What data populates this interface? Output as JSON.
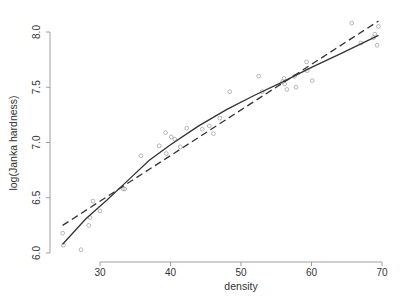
{
  "chart_data": {
    "type": "scatter",
    "title": "",
    "xlabel": "density",
    "ylabel": "log(Janka hardness)",
    "xlim": [
      23.5,
      70.5
    ],
    "ylim": [
      5.95,
      8.15
    ],
    "grid": false,
    "legend": null,
    "x_ticks": [
      30,
      40,
      50,
      60,
      70
    ],
    "y_ticks": [
      6.0,
      6.5,
      7.0,
      7.5,
      8.0
    ],
    "x_tick_labels": [
      "30",
      "40",
      "50",
      "60",
      "70"
    ],
    "y_tick_labels": [
      "6.0",
      "6.5",
      "7.0",
      "7.5",
      "8.0"
    ],
    "points": [
      [
        24.7,
        6.18
      ],
      [
        24.8,
        6.07
      ],
      [
        27.3,
        6.03
      ],
      [
        28.4,
        6.25
      ],
      [
        28.6,
        6.32
      ],
      [
        29.0,
        6.47
      ],
      [
        30.0,
        6.38
      ],
      [
        33.3,
        6.58
      ],
      [
        33.5,
        6.58
      ],
      [
        35.8,
        6.88
      ],
      [
        38.4,
        6.97
      ],
      [
        39.3,
        7.09
      ],
      [
        39.4,
        6.9
      ],
      [
        40.1,
        7.05
      ],
      [
        40.6,
        7.03
      ],
      [
        41.4,
        6.96
      ],
      [
        42.3,
        7.13
      ],
      [
        44.5,
        7.12
      ],
      [
        45.5,
        7.15
      ],
      [
        46.1,
        7.08
      ],
      [
        47.0,
        7.22
      ],
      [
        48.4,
        7.46
      ],
      [
        52.5,
        7.6
      ],
      [
        53.0,
        7.46
      ],
      [
        55.9,
        7.55
      ],
      [
        56.1,
        7.58
      ],
      [
        56.2,
        7.53
      ],
      [
        56.5,
        7.48
      ],
      [
        57.6,
        7.6
      ],
      [
        57.8,
        7.5
      ],
      [
        59.3,
        7.73
      ],
      [
        59.4,
        7.65
      ],
      [
        60.1,
        7.56
      ],
      [
        65.7,
        8.08
      ],
      [
        67.0,
        7.9
      ],
      [
        68.8,
        7.95
      ],
      [
        69.0,
        7.98
      ],
      [
        69.3,
        7.88
      ],
      [
        69.5,
        8.05
      ]
    ],
    "series": [
      {
        "name": "smooth fit",
        "style": "solid",
        "x": [
          24.7,
          28,
          31,
          34,
          37,
          40,
          44,
          48,
          52,
          56,
          60,
          64,
          69.5
        ],
        "y": [
          6.08,
          6.31,
          6.48,
          6.66,
          6.84,
          6.98,
          7.15,
          7.3,
          7.43,
          7.55,
          7.68,
          7.8,
          7.97
        ]
      },
      {
        "name": "linear fit",
        "style": "dashed",
        "x": [
          24.7,
          69.5
        ],
        "y": [
          6.25,
          8.1
        ]
      }
    ]
  }
}
